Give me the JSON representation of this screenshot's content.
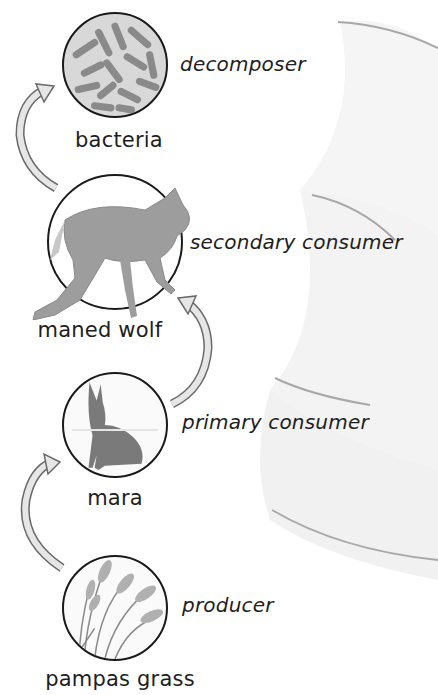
{
  "diagram": {
    "type": "food chain",
    "colors": {
      "outline": "#1a1a1a",
      "arrow_fill": "#e6e6e6",
      "arrow_stroke": "#6a6a6a",
      "organism_gray": "#9a9a9a",
      "decoration": "#f2f2f2"
    },
    "organisms": [
      {
        "name": "bacteria",
        "role": "decomposer",
        "icon": "bacteria-icon"
      },
      {
        "name": "maned wolf",
        "role": "secondary consumer",
        "icon": "maned-wolf-icon"
      },
      {
        "name": "mara",
        "role": "primary consumer",
        "icon": "mara-icon"
      },
      {
        "name": "pampas grass",
        "role": "producer",
        "icon": "pampas-grass-icon"
      }
    ],
    "arrows": [
      {
        "from": "pampas grass",
        "to": "mara"
      },
      {
        "from": "mara",
        "to": "maned wolf"
      },
      {
        "from": "maned wolf",
        "to": "bacteria"
      }
    ]
  }
}
